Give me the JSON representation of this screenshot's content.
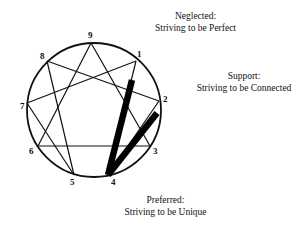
{
  "diagram": {
    "circle": {
      "cx": 94,
      "cy": 110,
      "r": 67
    },
    "points": [
      {
        "id": "1",
        "label": "1",
        "x": 136,
        "y": 61,
        "lx": 137,
        "ly": 57
      },
      {
        "id": "2",
        "label": "2",
        "x": 159,
        "y": 101,
        "lx": 163,
        "ly": 102
      },
      {
        "id": "3",
        "label": "3",
        "x": 150,
        "y": 146,
        "lx": 153,
        "ly": 154
      },
      {
        "id": "4",
        "label": "4",
        "x": 108,
        "y": 175,
        "lx": 111,
        "ly": 185
      },
      {
        "id": "5",
        "label": "5",
        "x": 74,
        "y": 175,
        "lx": 70,
        "ly": 185
      },
      {
        "id": "6",
        "label": "6",
        "x": 38,
        "y": 146,
        "lx": 29,
        "ly": 154
      },
      {
        "id": "7",
        "label": "7",
        "x": 27,
        "y": 103,
        "lx": 20,
        "ly": 109
      },
      {
        "id": "8",
        "label": "8",
        "x": 47,
        "y": 61,
        "lx": 40,
        "ly": 59
      },
      {
        "id": "9",
        "label": "9",
        "x": 91,
        "y": 43,
        "lx": 88,
        "ly": 38
      }
    ],
    "lines": [
      [
        "9",
        "3"
      ],
      [
        "3",
        "6"
      ],
      [
        "6",
        "9"
      ],
      [
        "1",
        "4"
      ],
      [
        "4",
        "2"
      ],
      [
        "2",
        "8"
      ],
      [
        "8",
        "5"
      ],
      [
        "5",
        "7"
      ],
      [
        "7",
        "1"
      ]
    ],
    "thick_bars": [
      {
        "from": [
          132,
          80
        ],
        "to": [
          108,
          175
        ],
        "meaning": "Neglected to Preferred"
      },
      {
        "from": [
          157,
          113
        ],
        "to": [
          108,
          175
        ],
        "meaning": "Support to Preferred"
      }
    ]
  },
  "labels": {
    "neglected": {
      "title": "Neglected:",
      "text": "Striving to be Perfect"
    },
    "support": {
      "title": "Support:",
      "text": "Striving to be Connected"
    },
    "preferred": {
      "title": "Preferred:",
      "text": "Striving to be Unique"
    }
  }
}
